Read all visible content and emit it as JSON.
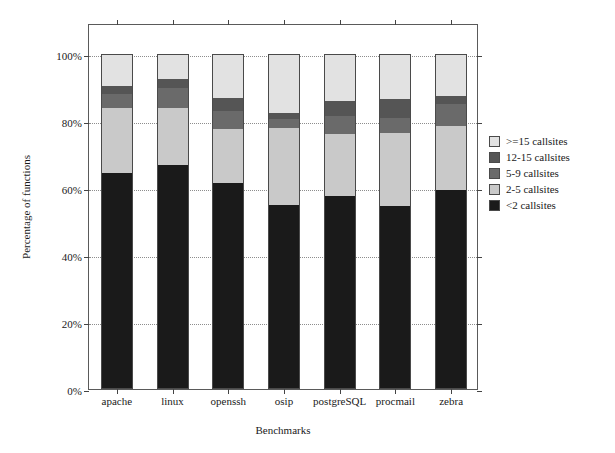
{
  "chart_data": {
    "type": "bar",
    "subtype": "stacked-bar-percentage",
    "title": "",
    "xlabel": "Benchmarks",
    "ylabel": "Percentage of functions",
    "categories": [
      "apache",
      "linux",
      "openssh",
      "osip",
      "postgreSQL",
      "procmail",
      "zebra"
    ],
    "ylim": [
      0,
      100
    ],
    "yticks": [
      0,
      20,
      40,
      60,
      80,
      100
    ],
    "ytick_labels": [
      "0%",
      "20%",
      "40%",
      "60%",
      "80%",
      "100%"
    ],
    "grid": true,
    "grid_axis": "y",
    "legend_position": "right",
    "stack_order_bottom_to_top": [
      "<2 callsites",
      "2-5 callsites",
      "5-9 callsites",
      "12-15 callsites",
      ">=15 callsites"
    ],
    "series": [
      {
        "name": "<2 callsites",
        "color": "#1a1a1a",
        "values": [
          64.5,
          67.0,
          61.5,
          55.0,
          57.5,
          54.5,
          59.5
        ]
      },
      {
        "name": "2-5 callsites",
        "color": "#c9c9c9",
        "values": [
          19.5,
          17.0,
          16.0,
          23.0,
          18.5,
          22.0,
          19.0
        ]
      },
      {
        "name": "5-9 callsites",
        "color": "#6a6a6a",
        "values": [
          4.0,
          6.0,
          5.5,
          2.5,
          5.5,
          4.5,
          6.5
        ]
      },
      {
        "name": "12-15 callsites",
        "color": "#555555",
        "values": [
          2.5,
          2.5,
          4.0,
          2.0,
          4.5,
          5.5,
          2.5
        ]
      },
      {
        "name": ">=15 callsites",
        "color": "#e2e2e2",
        "values": [
          9.5,
          7.5,
          13.0,
          17.5,
          14.0,
          13.5,
          12.5
        ]
      }
    ],
    "cumulative_tops_percent": {
      "apache": {
        "<2": 64.5,
        "2-5": 84.0,
        "5-9": 88.0,
        "12-15": 90.5,
        ">=15": 100.0
      },
      "linux": {
        "<2": 67.0,
        "2-5": 84.0,
        "5-9": 90.0,
        "12-15": 92.5,
        ">=15": 100.0
      },
      "openssh": {
        "<2": 61.5,
        "2-5": 77.5,
        "5-9": 83.0,
        "12-15": 87.0,
        ">=15": 100.0
      },
      "osip": {
        "<2": 55.0,
        "2-5": 78.0,
        "5-9": 80.5,
        "12-15": 82.5,
        ">=15": 100.0
      },
      "postgreSQL": {
        "<2": 57.5,
        "2-5": 76.0,
        "5-9": 81.5,
        "12-15": 86.0,
        ">=15": 100.0
      },
      "procmail": {
        "<2": 54.5,
        "2-5": 76.5,
        "5-9": 81.0,
        "12-15": 86.5,
        ">=15": 100.0
      },
      "zebra": {
        "<2": 59.5,
        "2-5": 78.5,
        "5-9": 85.0,
        "12-15": 87.5,
        ">=15": 100.0
      }
    }
  },
  "legend": {
    "items": [
      {
        "label": ">=15 callsites",
        "color": "#e2e2e2"
      },
      {
        "label": "12-15 callsites",
        "color": "#555555"
      },
      {
        "label": "5-9 callsites",
        "color": "#6a6a6a"
      },
      {
        "label": "2-5 callsites",
        "color": "#c9c9c9"
      },
      {
        "label": "<2 callsites",
        "color": "#1a1a1a"
      }
    ]
  },
  "axes": {
    "x_title": "Benchmarks",
    "y_title": "Percentage of functions",
    "y_tick_labels": [
      "100%",
      "80%",
      "60%",
      "40%",
      "20%",
      "0%"
    ],
    "x_tick_labels": [
      "apache",
      "linux",
      "openssh",
      "osip",
      "postgreSQL",
      "procmail",
      "zebra"
    ]
  }
}
